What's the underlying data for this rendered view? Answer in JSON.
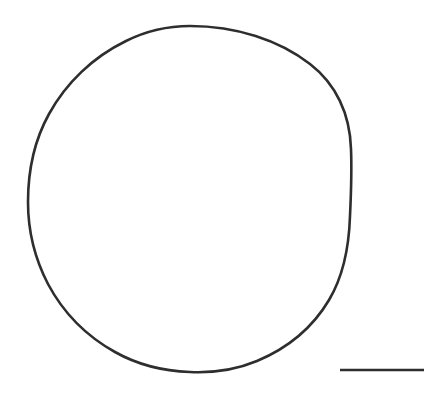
{
  "figure": {
    "kind": "micrograph-outline-figure",
    "background_color": "#ffffff",
    "width": 446,
    "height": 396,
    "caption": "",
    "label": ""
  },
  "chart_data": {
    "type": "scatter",
    "title": "",
    "subtitle": "",
    "xlabel": "",
    "ylabel": "",
    "grid": false,
    "legend": null,
    "axes_visible": false,
    "tick_labels": [],
    "annotations": [],
    "shapes": [
      {
        "name": "cell-outline",
        "shape": "closed-curve",
        "appearance": "hand-traced-irregular-circle",
        "stroke_color": "#2e2e2e",
        "stroke_width_px": 2.6,
        "fill": "none",
        "center_x": 190,
        "center_y": 199,
        "radius_x": 162,
        "radius_y": 173,
        "bbox": {
          "left": 28,
          "top": 26,
          "right": 352,
          "bottom": 372
        }
      },
      {
        "name": "scale-bar",
        "shape": "horizontal-line",
        "stroke_color": "#2e2e2e",
        "stroke_width_px": 2.3,
        "x1": 340,
        "y1": 370,
        "x2": 424,
        "y2": 370,
        "length_px": 84,
        "label": ""
      }
    ]
  },
  "scalebar": {
    "label": "",
    "units": "",
    "value": ""
  },
  "colors": {
    "ink": "#2e2e2e",
    "paper": "#ffffff"
  }
}
